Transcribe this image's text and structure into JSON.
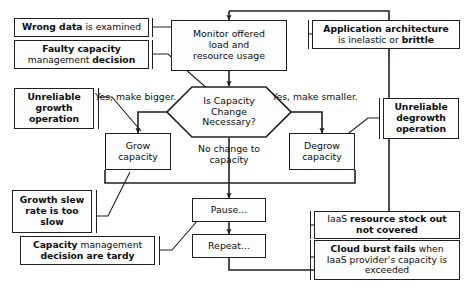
{
  "diagram": {
    "colors": {
      "stroke": "#231f20",
      "text": "#0d0d0d",
      "background": "#ffffff",
      "node_fill": "#fdfdfd"
    }
  },
  "nodes": {
    "monitor": {
      "name": "monitor-offered-load",
      "line1": "Monitor offered",
      "line2": "load and",
      "line3": "resource usage"
    },
    "decision": {
      "name": "is-capacity-change-necessary",
      "line1": "Is Capacity",
      "line2": "Change",
      "line3": "Necessary?"
    },
    "grow": {
      "name": "grow-capacity",
      "line1": "Grow",
      "line2": "capacity"
    },
    "degrow": {
      "name": "degrow-capacity",
      "line1": "Degrow",
      "line2": "capacity"
    },
    "pause": {
      "name": "pause",
      "label": "Pause..."
    },
    "repeat": {
      "name": "repeat",
      "label": "Repeat..."
    }
  },
  "annotations": {
    "wrong_data": {
      "bold1": "Wrong data",
      "rest1": " is examined"
    },
    "faulty_capacity": {
      "bold1": "Faulty capacity",
      "plain2": "management ",
      "bold2": "decision"
    },
    "unreliable_growth": {
      "line1": "Unreliable",
      "line2": "growth",
      "line3": "operation"
    },
    "growth_slew": {
      "line1": "Growth slew",
      "line2": "rate is too",
      "line3": "slow"
    },
    "capacity_tardy": {
      "bold1": "Capacity",
      "rest1": " management",
      "line2": "decision are tardy"
    },
    "app_architecture": {
      "bold1": "Application architecture",
      "plain2a": "is inelastic or ",
      "bold2b": "brittle"
    },
    "unreliable_degrowth": {
      "line1": "Unreliable",
      "line2": "degrowth",
      "line3": "operation"
    },
    "iaas_stock_out": {
      "plain1": "IaaS ",
      "bold1": "resource stock out",
      "line2": "not covered"
    },
    "cloud_burst": {
      "bold1": "Cloud burst fails",
      "rest1": " when",
      "line2": "IaaS provider's capacity is",
      "line3": "exceeded"
    }
  },
  "edge_labels": {
    "yes_bigger": "Yes, make bigger.",
    "yes_smaller": "Yes, make smaller.",
    "no_change_1": "No change to",
    "no_change_2": "capacity"
  }
}
